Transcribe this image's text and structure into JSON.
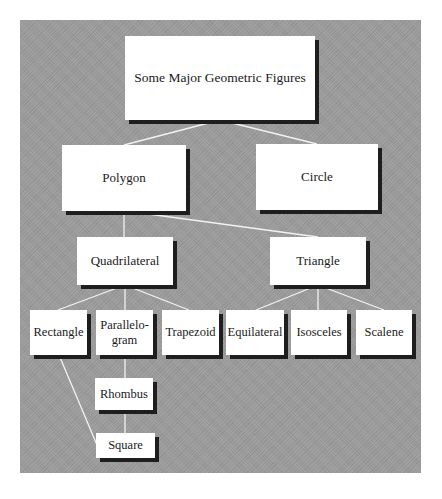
{
  "diagram": {
    "title": "Some Major Geometric Figures",
    "colors": {
      "background": "#9b9b9b",
      "node_fill": "#ffffff",
      "shadow": "#1e1e1e",
      "connector": "#f2f2f2",
      "text": "#1a1a1a"
    },
    "nodes": {
      "root": {
        "label": "Some Major Geometric Figures"
      },
      "polygon": {
        "label": "Polygon"
      },
      "circle": {
        "label": "Circle"
      },
      "quadrilateral": {
        "label": "Quadrilateral"
      },
      "triangle": {
        "label": "Triangle"
      },
      "rectangle": {
        "label": "Rectangle"
      },
      "parallelogram": {
        "label": "Parallelo-\ngram"
      },
      "trapezoid": {
        "label": "Trapezoid"
      },
      "equilateral": {
        "label": "Equilateral"
      },
      "isosceles": {
        "label": "Isosceles"
      },
      "scalene": {
        "label": "Scalene"
      },
      "rhombus": {
        "label": "Rhombus"
      },
      "square": {
        "label": "Square"
      }
    },
    "edges": [
      [
        "root",
        "polygon"
      ],
      [
        "root",
        "circle"
      ],
      [
        "polygon",
        "quadrilateral"
      ],
      [
        "polygon",
        "triangle"
      ],
      [
        "quadrilateral",
        "rectangle"
      ],
      [
        "quadrilateral",
        "parallelogram"
      ],
      [
        "quadrilateral",
        "trapezoid"
      ],
      [
        "triangle",
        "equilateral"
      ],
      [
        "triangle",
        "isosceles"
      ],
      [
        "triangle",
        "scalene"
      ],
      [
        "parallelogram",
        "rhombus"
      ],
      [
        "rhombus",
        "square"
      ],
      [
        "rectangle",
        "square"
      ]
    ]
  }
}
